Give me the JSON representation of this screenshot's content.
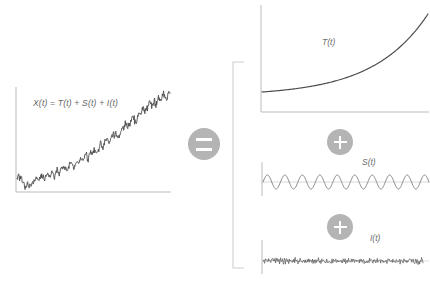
{
  "figure": {
    "title_equation": "X(t) = T(t) + S(t) + I(t)",
    "palette": {
      "series_stroke": "#4d4d4d",
      "axis_stroke": "#b9b9b9",
      "bracket_stroke": "#cfcfcf",
      "badge_fill": "#b4b4b4",
      "badge_glyph": "#ffffff",
      "label_text": "#6b6b6b",
      "background": "#ffffff"
    },
    "operators": [
      {
        "name": "equals-badge",
        "symbol": "=",
        "cx": 204,
        "cy": 144,
        "r": 16
      },
      {
        "name": "plus-badge-trend-seasonal",
        "symbol": "+",
        "cx": 340,
        "cy": 142,
        "r": 13
      },
      {
        "name": "plus-badge-seasonal-irregular",
        "symbol": "+",
        "cx": 340,
        "cy": 227,
        "r": 13
      }
    ],
    "bracket": {
      "name": "grouping-bracket",
      "x": 233,
      "y_top": 62,
      "y_bottom": 268,
      "arm_width": 11
    }
  },
  "chart_data": [
    {
      "id": "observed",
      "type": "line",
      "title": "X(t)",
      "annotation": "X(t) = T(t) + S(t) + I(t)",
      "xlabel": "t",
      "ylabel": "X(t)",
      "grid": false,
      "legend": "none",
      "description": "Observed series: upward trending random walk with noise",
      "xlim": [
        0,
        100
      ],
      "ylim": [
        0,
        100
      ],
      "values": [
        18,
        16,
        14,
        17,
        13,
        11,
        9,
        7,
        10,
        8,
        6,
        9,
        12,
        10,
        13,
        16,
        14,
        12,
        15,
        18,
        16,
        14,
        17,
        20,
        18,
        16,
        19,
        22,
        20,
        18,
        21,
        24,
        22,
        20,
        23,
        26,
        24,
        27,
        25,
        23,
        26,
        29,
        31,
        28,
        26,
        29,
        32,
        30,
        28,
        31,
        34,
        32,
        35,
        38,
        36,
        34,
        37,
        40,
        38,
        41,
        44,
        42,
        40,
        43,
        46,
        49,
        47,
        45,
        48,
        51,
        54,
        52,
        50,
        53,
        56,
        59,
        57,
        60,
        58,
        56,
        59,
        62,
        65,
        63,
        66,
        69,
        67,
        65,
        68,
        71,
        74,
        72,
        70,
        73,
        76,
        79,
        77,
        80,
        83,
        81,
        84,
        82,
        85,
        88,
        86,
        84,
        87,
        90,
        88,
        91,
        94,
        92,
        90,
        93,
        96,
        94,
        92,
        95,
        98,
        96
      ]
    },
    {
      "id": "trend",
      "type": "line",
      "title": "T(t)",
      "xlabel": "t",
      "ylabel": "T(t)",
      "grid": false,
      "legend": "none",
      "description": "Trend component: flat then exponentially increasing",
      "xlim": [
        0,
        100
      ],
      "ylim": [
        0,
        100
      ],
      "curve": "exponential",
      "values": [
        8,
        8,
        8,
        8,
        8,
        8,
        9,
        9,
        9,
        9,
        10,
        10,
        10,
        11,
        11,
        12,
        12,
        13,
        13,
        14,
        15,
        16,
        16,
        17,
        18,
        19,
        20,
        21,
        22,
        23,
        25,
        26,
        27,
        29,
        30,
        32,
        33,
        35,
        37,
        38,
        40,
        42,
        44,
        46,
        48,
        50,
        52,
        54,
        56,
        58,
        61,
        63,
        65,
        68,
        70,
        73,
        75,
        78,
        80,
        83,
        86,
        88,
        91,
        94,
        97,
        99,
        102,
        105,
        108,
        111
      ]
    },
    {
      "id": "seasonal",
      "type": "line",
      "title": "S(t)",
      "xlabel": "t",
      "ylabel": "S(t)",
      "grid": false,
      "legend": "none",
      "description": "Seasonal component: regular sinusoid",
      "waveform": "sine",
      "cycles": 9.5,
      "amplitude": 7,
      "baseline": 0,
      "xlim": [
        0,
        100
      ],
      "ylim": [
        -10,
        10
      ]
    },
    {
      "id": "irregular",
      "type": "line",
      "title": "I(t)",
      "xlabel": "t",
      "ylabel": "I(t)",
      "grid": false,
      "legend": "none",
      "description": "Irregular component: zero-mean white noise",
      "waveform": "white-noise",
      "amplitude": 3,
      "baseline": 0,
      "xlim": [
        0,
        100
      ],
      "ylim": [
        -6,
        6
      ],
      "values": [
        0.4,
        -1.1,
        0.9,
        -0.3,
        1.8,
        -0.7,
        0.2,
        -1.6,
        1.2,
        0.5,
        -0.9,
        1.4,
        -0.4,
        0.8,
        -1.9,
        0.6,
        1.1,
        -0.5,
        0.3,
        -1.3,
        0.7,
        1.6,
        -0.8,
        0.1,
        -1.4,
        1.0,
        -0.2,
        0.9,
        -1.7,
        0.4,
        1.3,
        -0.6,
        0.2,
        -1.0,
        1.5,
        -0.3,
        0.8,
        -1.2,
        0.5,
        1.9,
        -0.7,
        0.3,
        -1.5,
        1.1,
        -0.4,
        0.6,
        -0.9,
        1.7,
        -0.2,
        0.4,
        -1.8,
        0.9,
        1.2,
        -0.5,
        0.7,
        -1.1,
        0.3,
        1.4,
        -0.6,
        0.8,
        -0.3,
        1.0,
        -1.6,
        0.5,
        0.2,
        -0.8,
        1.3,
        -0.4,
        0.9,
        -1.2
      ]
    }
  ],
  "labels": {
    "observed_equation": "X(t) = T(t) + S(t) + I(t)",
    "trend": "T(t)",
    "seasonal": "S(t)",
    "irregular": "I(t)"
  }
}
